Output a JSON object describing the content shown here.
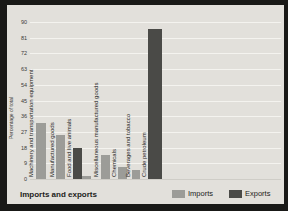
{
  "chart_data": {
    "type": "bar",
    "title": "Imports and exports",
    "ylabel": "Percentage of total",
    "ylim": [
      0,
      90
    ],
    "ytick_step": 9,
    "yticks": [
      90,
      81,
      72,
      63,
      54,
      45,
      36,
      27,
      18,
      9,
      0
    ],
    "grid": true,
    "legend_position": "bottom-right",
    "series": [
      {
        "name": "Imports",
        "color": "#9c9c98"
      },
      {
        "name": "Exports",
        "color": "#4a4a47"
      }
    ],
    "groups": [
      {
        "category": "Machinery and transportation equipment",
        "bars": [
          {
            "series": "Imports",
            "value": 32
          }
        ]
      },
      {
        "category": "Manufactured goods",
        "bars": [
          {
            "series": "Imports",
            "value": 25
          }
        ]
      },
      {
        "category": "Food and live animals",
        "bars": [
          {
            "series": "Exports",
            "value": 18
          },
          {
            "series": "Imports",
            "value": 2
          }
        ]
      },
      {
        "category": "Miscellaneous manufactured goods",
        "bars": [
          {
            "series": "Imports",
            "value": 14
          }
        ]
      },
      {
        "category": "Chemicals",
        "bars": [
          {
            "series": "Imports",
            "value": 7
          }
        ]
      },
      {
        "category": "Beverages and tobacco",
        "bars": [
          {
            "series": "Imports",
            "value": 5
          }
        ]
      },
      {
        "category": "Crude petroleum",
        "bars": [
          {
            "series": "Exports",
            "value": 86
          }
        ]
      }
    ]
  }
}
